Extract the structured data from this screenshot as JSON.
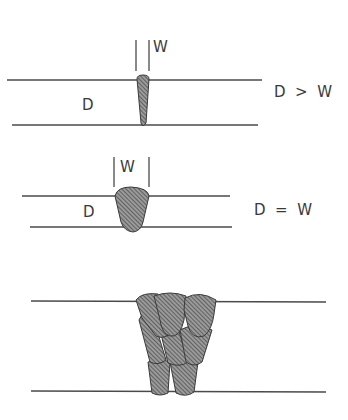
{
  "diagram": {
    "panels": [
      {
        "id": "deep-narrow",
        "depth_label": "D",
        "width_label": "W",
        "relation": "D  >  W"
      },
      {
        "id": "equal",
        "depth_label": "D",
        "width_label": "W",
        "relation": "D  =  W"
      },
      {
        "id": "multi-pass",
        "depth_label": "",
        "width_label": "",
        "relation": ""
      }
    ],
    "colors": {
      "line": "#4a4a4a",
      "weld_fill": "#8a8a8a",
      "hatch": "#3c3c3c",
      "text": "#3a3a3a",
      "background": "#ffffff"
    }
  }
}
